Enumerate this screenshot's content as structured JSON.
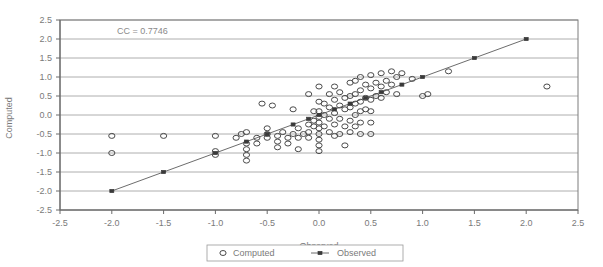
{
  "chart_data": {
    "type": "scatter",
    "title": "",
    "xlabel": "Observed",
    "ylabel": "Computed",
    "xlim": [
      -2.5,
      2.5
    ],
    "ylim": [
      -2.5,
      2.5
    ],
    "xticks": [
      "-2.5",
      "-2.0",
      "-1.5",
      "-1.0",
      "-0.5",
      "0.0",
      "0.5",
      "1.0",
      "1.5",
      "2.0",
      "2.5"
    ],
    "yticks": [
      "2.5",
      "2.0",
      "1.5",
      "1.0",
      "0.5",
      "0.0",
      "-0.5",
      "-1.0",
      "-1.5",
      "-2.0",
      "-2.5"
    ],
    "grid": "horizontal",
    "legend_position": "bottom",
    "annotation": "CC = 0.7746",
    "series": [
      {
        "name": "Computed",
        "marker": "open-circle",
        "points": [
          [
            -2.0,
            -0.55
          ],
          [
            -2.0,
            -1.0
          ],
          [
            -1.5,
            -0.55
          ],
          [
            -1.0,
            -0.55
          ],
          [
            -1.0,
            -0.95
          ],
          [
            -1.0,
            -1.05
          ],
          [
            -0.8,
            -0.6
          ],
          [
            -0.75,
            -0.5
          ],
          [
            -0.7,
            -0.45
          ],
          [
            -0.7,
            -0.75
          ],
          [
            -0.7,
            -0.9
          ],
          [
            -0.7,
            -1.05
          ],
          [
            -0.7,
            -1.2
          ],
          [
            -0.6,
            -0.6
          ],
          [
            -0.6,
            -0.75
          ],
          [
            -0.55,
            0.3
          ],
          [
            -0.5,
            -0.35
          ],
          [
            -0.5,
            -0.5
          ],
          [
            -0.5,
            -0.6
          ],
          [
            -0.45,
            0.25
          ],
          [
            -0.4,
            -0.55
          ],
          [
            -0.4,
            -0.7
          ],
          [
            -0.4,
            -0.85
          ],
          [
            -0.35,
            -0.45
          ],
          [
            -0.3,
            -0.6
          ],
          [
            -0.3,
            -0.75
          ],
          [
            -0.25,
            0.15
          ],
          [
            -0.25,
            -0.5
          ],
          [
            -0.2,
            -0.35
          ],
          [
            -0.2,
            -0.6
          ],
          [
            -0.2,
            -0.9
          ],
          [
            -0.15,
            -0.5
          ],
          [
            -0.1,
            0.55
          ],
          [
            -0.1,
            -0.25
          ],
          [
            -0.1,
            -0.45
          ],
          [
            -0.1,
            -0.6
          ],
          [
            -0.05,
            0.1
          ],
          [
            -0.05,
            -0.15
          ],
          [
            -0.05,
            -0.3
          ],
          [
            0.0,
            0.75
          ],
          [
            0.0,
            0.35
          ],
          [
            0.0,
            0.1
          ],
          [
            0.0,
            -0.05
          ],
          [
            0.0,
            -0.2
          ],
          [
            0.0,
            -0.35
          ],
          [
            0.0,
            -0.5
          ],
          [
            0.0,
            -0.65
          ],
          [
            0.0,
            -0.8
          ],
          [
            0.0,
            -0.95
          ],
          [
            0.05,
            0.3
          ],
          [
            0.05,
            0.0
          ],
          [
            0.05,
            -0.3
          ],
          [
            0.1,
            0.55
          ],
          [
            0.1,
            0.2
          ],
          [
            0.1,
            -0.1
          ],
          [
            0.1,
            -0.45
          ],
          [
            0.15,
            0.75
          ],
          [
            0.15,
            0.4
          ],
          [
            0.15,
            0.05
          ],
          [
            0.15,
            -0.25
          ],
          [
            0.15,
            -0.55
          ],
          [
            0.2,
            0.6
          ],
          [
            0.2,
            0.25
          ],
          [
            0.2,
            -0.1
          ],
          [
            0.2,
            -0.5
          ],
          [
            0.25,
            0.45
          ],
          [
            0.25,
            0.15
          ],
          [
            0.25,
            -0.3
          ],
          [
            0.25,
            -0.8
          ],
          [
            0.3,
            0.85
          ],
          [
            0.3,
            0.5
          ],
          [
            0.3,
            0.2
          ],
          [
            0.3,
            -0.15
          ],
          [
            0.3,
            -0.45
          ],
          [
            0.35,
            0.9
          ],
          [
            0.35,
            0.55
          ],
          [
            0.35,
            0.3
          ],
          [
            0.35,
            0.0
          ],
          [
            0.35,
            -0.3
          ],
          [
            0.4,
            1.0
          ],
          [
            0.4,
            0.65
          ],
          [
            0.4,
            0.35
          ],
          [
            0.4,
            0.1
          ],
          [
            0.4,
            -0.2
          ],
          [
            0.4,
            -0.5
          ],
          [
            0.45,
            0.8
          ],
          [
            0.45,
            0.45
          ],
          [
            0.45,
            0.15
          ],
          [
            0.5,
            1.05
          ],
          [
            0.5,
            0.7
          ],
          [
            0.5,
            0.4
          ],
          [
            0.5,
            0.1
          ],
          [
            0.5,
            -0.2
          ],
          [
            0.5,
            -0.5
          ],
          [
            0.55,
            0.85
          ],
          [
            0.55,
            0.5
          ],
          [
            0.6,
            1.1
          ],
          [
            0.6,
            0.75
          ],
          [
            0.6,
            0.45
          ],
          [
            0.65,
            0.9
          ],
          [
            0.65,
            0.6
          ],
          [
            0.7,
            1.15
          ],
          [
            0.7,
            0.8
          ],
          [
            0.75,
            1.0
          ],
          [
            0.75,
            0.55
          ],
          [
            0.8,
            1.1
          ],
          [
            0.9,
            0.95
          ],
          [
            1.0,
            0.5
          ],
          [
            1.05,
            0.55
          ],
          [
            1.25,
            1.15
          ],
          [
            2.2,
            0.75
          ]
        ]
      },
      {
        "name": "Observed",
        "marker": "small-square-line",
        "line": true,
        "points": [
          [
            -2.0,
            -2.0
          ],
          [
            -1.5,
            -1.5
          ],
          [
            -1.0,
            -1.0
          ],
          [
            -0.7,
            -0.7
          ],
          [
            -0.5,
            -0.5
          ],
          [
            -0.25,
            -0.25
          ],
          [
            -0.1,
            -0.1
          ],
          [
            0.0,
            0.0
          ],
          [
            0.15,
            0.15
          ],
          [
            0.3,
            0.3
          ],
          [
            0.45,
            0.45
          ],
          [
            0.6,
            0.6
          ],
          [
            0.8,
            0.8
          ],
          [
            1.0,
            1.0
          ],
          [
            1.5,
            1.5
          ],
          [
            2.0,
            2.0
          ]
        ]
      }
    ],
    "legend": [
      {
        "label": "Computed",
        "marker": "open-circle"
      },
      {
        "label": "Observed",
        "marker": "small-square-line"
      }
    ]
  }
}
